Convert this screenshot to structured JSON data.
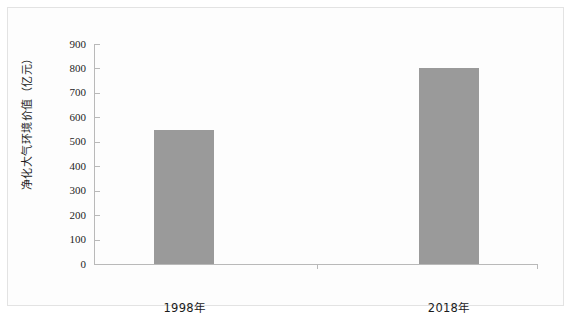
{
  "chart_data": {
    "type": "bar",
    "title": "",
    "subtitle": "",
    "xlabel": "",
    "ylabel": "净化大气环境价值（亿元）",
    "categories": [
      "1998年",
      "2018年"
    ],
    "values": [
      550,
      800
    ],
    "series": [
      {
        "name": "净化大气环境价值",
        "values": [
          550,
          800
        ]
      }
    ],
    "ylim": [
      0,
      900
    ],
    "y_ticks": [
      0,
      100,
      200,
      300,
      400,
      500,
      600,
      700,
      800,
      900
    ],
    "y_tick_labels": [
      "0",
      "100",
      "200",
      "300",
      "400",
      "500",
      "600",
      "700",
      "800",
      "900"
    ],
    "grid": false,
    "legend": false,
    "legend_position": "none",
    "bar_color": "#9a9a9a",
    "axis_color": "#b9b9b9",
    "frame_color": "#e3e3e3",
    "background_color": "#ffffff"
  }
}
